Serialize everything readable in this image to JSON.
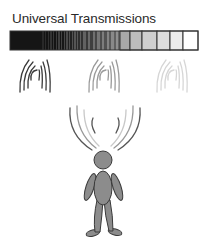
{
  "title": "Universal Transmissions",
  "bar": {
    "x": 10,
    "y": 31,
    "width": 188,
    "height": 19,
    "solid_end": 42,
    "stripe_end": 120,
    "outline": "#333333",
    "boxes": [
      {
        "x": 120,
        "w": 10,
        "fill": "#a8a8a8"
      },
      {
        "x": 130,
        "w": 12,
        "fill": "#bdbdbd"
      },
      {
        "x": 142,
        "w": 15,
        "fill": "#cfcfcf"
      },
      {
        "x": 157,
        "w": 13,
        "fill": "#dedede"
      },
      {
        "x": 170,
        "w": 13,
        "fill": "#ececec"
      },
      {
        "x": 183,
        "w": 15,
        "fill": "#ffffff"
      }
    ]
  },
  "wave_groups": [
    {
      "name": "dark",
      "cx": 35,
      "color": "#3a3a3a"
    },
    {
      "name": "medium",
      "cx": 104,
      "color": "#9a9a9a"
    },
    {
      "name": "light",
      "cx": 172,
      "color": "#d6d6d6"
    }
  ],
  "figure": {
    "fill": "#8c8c8c",
    "stroke": "#3a3a3a",
    "head": {
      "cx": 103,
      "cy": 160,
      "r": 9
    }
  },
  "emanation_colors": [
    "#555555",
    "#999999",
    "#c8c8c8"
  ]
}
